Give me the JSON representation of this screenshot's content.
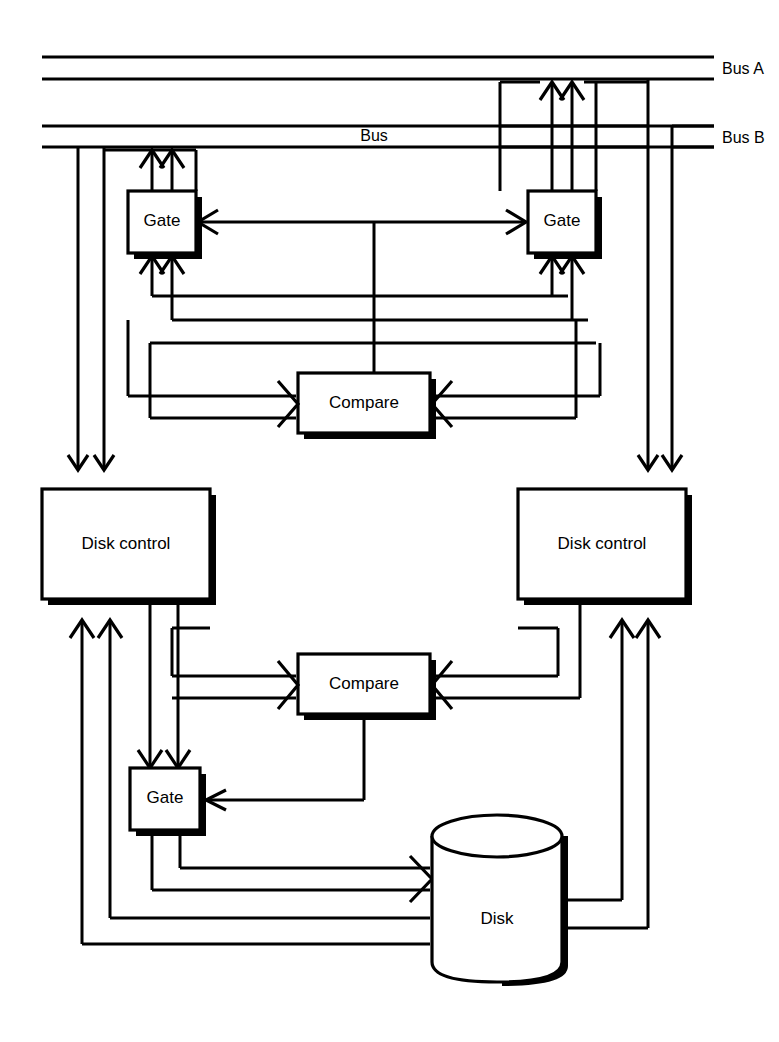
{
  "figure": {
    "type": "block-diagram",
    "background_color": "#ffffff",
    "line_color": "#000000"
  },
  "buses": {
    "lines": [
      {
        "id": "bus-a-upper",
        "y": 57,
        "x1": 42,
        "x2": 714,
        "label": ""
      },
      {
        "id": "bus-a-lower",
        "y": 79,
        "x1": 42,
        "x2": 714,
        "label": "Bus A"
      },
      {
        "id": "bus-b-upper",
        "y": 126,
        "x1": 42,
        "x2": 714,
        "label": ""
      },
      {
        "id": "bus-b-lower",
        "y": 147,
        "x1": 42,
        "x2": 714,
        "label": "Bus B"
      }
    ],
    "labels": {
      "bus_a": "Bus A",
      "bus_b": "Bus B",
      "bus_center": "Bus"
    }
  },
  "blocks": [
    {
      "id": "gate-top-left",
      "label": "Gate",
      "shape": "rect",
      "x": 128,
      "y": 191,
      "w": 68,
      "h": 62
    },
    {
      "id": "gate-top-right",
      "label": "Gate",
      "shape": "rect",
      "x": 528,
      "y": 191,
      "w": 68,
      "h": 62
    },
    {
      "id": "compare-top",
      "label": "Compare",
      "shape": "rect",
      "x": 298,
      "y": 373,
      "w": 132,
      "h": 60
    },
    {
      "id": "disk-control-left",
      "label": "Disk control",
      "shape": "rect",
      "x": 42,
      "y": 489,
      "w": 168,
      "h": 110
    },
    {
      "id": "disk-control-right",
      "label": "Disk control",
      "shape": "rect",
      "x": 518,
      "y": 489,
      "w": 168,
      "h": 110
    },
    {
      "id": "compare-bottom",
      "label": "Compare",
      "shape": "rect",
      "x": 298,
      "y": 654,
      "w": 132,
      "h": 60
    },
    {
      "id": "gate-bottom",
      "label": "Gate",
      "shape": "rect",
      "x": 130,
      "y": 768,
      "w": 70,
      "h": 62
    },
    {
      "id": "disk",
      "label": "Disk",
      "shape": "cylinder",
      "x": 432,
      "y": 812,
      "w": 130,
      "h": 160
    }
  ],
  "labels": {
    "gate": "Gate",
    "compare": "Compare",
    "disk_control": "Disk control",
    "disk": "Disk",
    "bus": "Bus",
    "bus_a": "Bus A",
    "bus_b": "Bus B"
  },
  "connections": [
    {
      "from": "gate-top-left",
      "to": "bus-b-lower",
      "type": "double-arrow-up"
    },
    {
      "from": "gate-top-right",
      "to": "bus-a-lower",
      "type": "double-arrow-up"
    },
    {
      "from": "gate-top-left",
      "to": "gate-top-right",
      "type": "bidirectional"
    },
    {
      "from": "compare-top",
      "to": "gate-link",
      "type": "line-up"
    },
    {
      "from": "disk-control-left",
      "to": "compare-top",
      "type": "double-arrow-right"
    },
    {
      "from": "disk-control-right",
      "to": "compare-top",
      "type": "double-arrow-left"
    },
    {
      "from": "bus",
      "to": "disk-control-left",
      "type": "double-arrow-down"
    },
    {
      "from": "bus",
      "to": "disk-control-right",
      "type": "double-arrow-down"
    },
    {
      "from": "disk-control-left",
      "to": "compare-bottom",
      "type": "double-arrow-right"
    },
    {
      "from": "disk-control-right",
      "to": "compare-bottom",
      "type": "double-arrow-left"
    },
    {
      "from": "compare-bottom",
      "to": "gate-bottom",
      "type": "arrow-left"
    },
    {
      "from": "disk-control-left",
      "to": "gate-bottom",
      "type": "double-arrow-down"
    },
    {
      "from": "gate-bottom",
      "to": "disk",
      "type": "double-arrow-right"
    },
    {
      "from": "disk",
      "to": "disk-control-left",
      "type": "double-arrow-up"
    },
    {
      "from": "disk",
      "to": "disk-control-right",
      "type": "double-arrow-up"
    }
  ]
}
